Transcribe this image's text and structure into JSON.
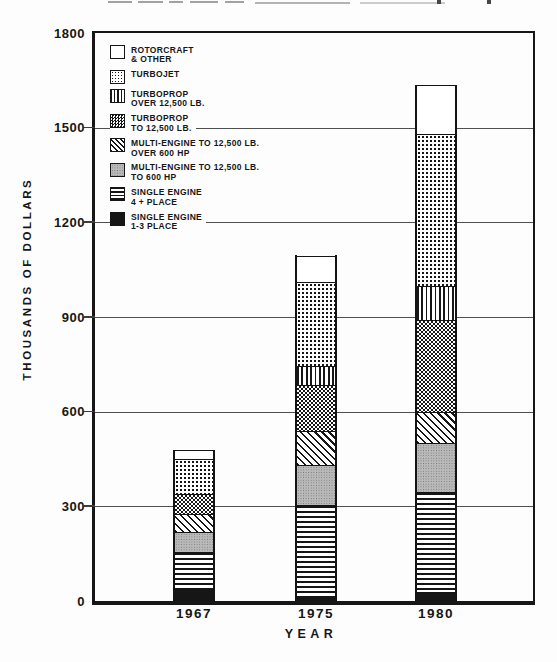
{
  "figure": {
    "y_axis_title": "THOUSANDS OF DOLLARS",
    "x_axis_title": "YEAR"
  },
  "legend": [
    {
      "line1": "ROTORCRAFT",
      "line2": "& OTHER",
      "pattern": "blank"
    },
    {
      "line1": "TURBOJET",
      "line2": "",
      "pattern": "dot-grid"
    },
    {
      "line1": "TURBOPROP",
      "line2": "OVER 12,500 LB.",
      "pattern": "vertical-lines"
    },
    {
      "line1": "TURBOPROP",
      "line2": "TO 12,500 LB.",
      "pattern": "checker"
    },
    {
      "line1": "MULTI-ENGINE TO 12,500 LB.",
      "line2": "OVER 600 HP",
      "pattern": "diagonal-lines"
    },
    {
      "line1": "MULTI-ENGINE TO 12,500 LB.",
      "line2": "TO 600 HP",
      "pattern": "stipple"
    },
    {
      "line1": "SINGLE ENGINE",
      "line2": "4 + PLACE",
      "pattern": "horizontal-lines"
    },
    {
      "line1": "SINGLE ENGINE",
      "line2": "1-3 PLACE",
      "pattern": "solid-black"
    }
  ],
  "chart_data": {
    "type": "bar",
    "stacked": true,
    "title": "",
    "ylabel": "THOUSANDS OF DOLLARS",
    "xlabel": "YEAR",
    "categories": [
      "1967",
      "1975",
      "1980"
    ],
    "series": [
      {
        "name": "SINGLE ENGINE 1-3 PLACE",
        "pattern": "solid-black",
        "values": [
          40,
          15,
          30
        ]
      },
      {
        "name": "SINGLE ENGINE 4 + PLACE",
        "pattern": "horizontal-lines",
        "values": [
          115,
          290,
          315
        ]
      },
      {
        "name": "MULTI-ENGINE TO 12,500 LB. TO 600 HP",
        "pattern": "stipple",
        "values": [
          65,
          125,
          155
        ]
      },
      {
        "name": "MULTI-ENGINE TO 12,500 LB. OVER 600 HP",
        "pattern": "diagonal-lines",
        "values": [
          55,
          110,
          100
        ]
      },
      {
        "name": "TURBOPROP TO 12,500 LB.",
        "pattern": "checker",
        "values": [
          65,
          145,
          290
        ]
      },
      {
        "name": "TURBOPROP OVER 12,500 LB.",
        "pattern": "vertical-lines",
        "values": [
          0,
          60,
          110
        ]
      },
      {
        "name": "TURBOJET",
        "pattern": "dot-grid",
        "values": [
          110,
          265,
          480
        ]
      },
      {
        "name": "ROTORCRAFT & OTHER",
        "pattern": "blank",
        "values": [
          30,
          85,
          155
        ]
      }
    ],
    "totals": [
      480,
      1095,
      1635
    ],
    "ylim": [
      0,
      1800
    ],
    "yticks": [
      0,
      300,
      600,
      900,
      1200,
      1500,
      1800
    ],
    "gridlines": [
      300,
      600,
      900,
      1200,
      1500
    ],
    "grid": "horizontal",
    "legend_position": "upper-left-inside",
    "ink_color": "#161616",
    "paper_color": "#fdfdfd"
  }
}
